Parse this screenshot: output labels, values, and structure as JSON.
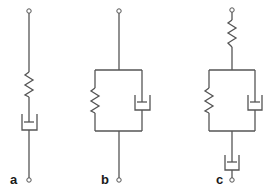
{
  "figure": {
    "stroke_color": "#555555",
    "background": "#ffffff",
    "models": [
      {
        "label": "a",
        "name": "Maxwell model",
        "elements": [
          "spring",
          "dashpot"
        ],
        "arrangement": "series"
      },
      {
        "label": "b",
        "name": "Kelvin-Voigt model",
        "elements": [
          "spring",
          "dashpot"
        ],
        "arrangement": "parallel"
      },
      {
        "label": "c",
        "name": "Burgers model",
        "elements": [
          "spring",
          "parallel(spring, dashpot)",
          "dashpot"
        ],
        "arrangement": "series"
      }
    ]
  }
}
